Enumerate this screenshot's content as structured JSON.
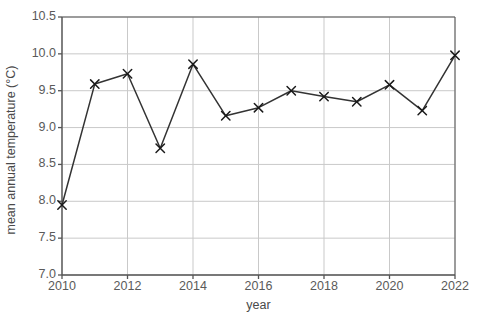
{
  "chart_data": {
    "type": "line",
    "title": "",
    "subtitle": "",
    "xlabel": "year",
    "ylabel": "mean annual temperature (°C)",
    "x": [
      2010,
      2011,
      2012,
      2013,
      2014,
      2015,
      2016,
      2017,
      2018,
      2019,
      2020,
      2021,
      2022
    ],
    "values": [
      7.95,
      9.59,
      9.73,
      8.72,
      9.86,
      9.16,
      9.27,
      9.5,
      9.42,
      9.35,
      9.58,
      9.23,
      9.98
    ],
    "series": [
      {
        "name": "mean annual temperature",
        "values": [
          7.95,
          9.59,
          9.73,
          8.72,
          9.86,
          9.16,
          9.27,
          9.5,
          9.42,
          9.35,
          9.58,
          9.23,
          9.98
        ]
      }
    ],
    "xlim": [
      2010,
      2022
    ],
    "ylim": [
      7.0,
      10.5
    ],
    "xticks": [
      2010,
      2012,
      2014,
      2016,
      2018,
      2020,
      2022
    ],
    "xtick_labels": [
      "2010",
      "2012",
      "2014",
      "2016",
      "2018",
      "2020",
      "2022"
    ],
    "yticks": [
      7.0,
      7.5,
      8.0,
      8.5,
      9.0,
      9.5,
      10.0,
      10.5
    ],
    "ytick_labels": [
      "7.0",
      "7.5",
      "8.0",
      "8.5",
      "9.0",
      "9.5",
      "10.0",
      "10.5"
    ],
    "grid": true,
    "grid_axis": "both",
    "legend": false,
    "legend_position": "none",
    "marker": "x",
    "colors": {
      "line": "#333333",
      "marker": "#1a1a1a",
      "grid": "#c9c9c9",
      "axis": "#555555",
      "background": "#ffffff",
      "text": "#4a4a4a"
    }
  }
}
